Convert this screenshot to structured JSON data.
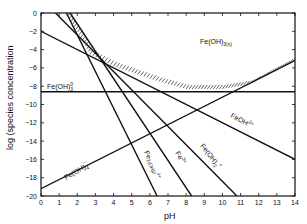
{
  "chart_data": {
    "type": "line",
    "title": "",
    "xlabel": "pH",
    "ylabel": "log (species concentration",
    "xlim": [
      0,
      14
    ],
    "ylim": [
      -20,
      0
    ],
    "x_ticks": [
      0,
      1,
      2,
      3,
      4,
      5,
      6,
      7,
      8,
      9,
      10,
      11,
      12,
      13,
      14
    ],
    "y_ticks": [
      0,
      -2,
      -4,
      -6,
      -8,
      -10,
      -12,
      -14,
      -16,
      -18,
      -20
    ],
    "grid": false,
    "region_label": "Fe(OH)3(s)",
    "series": [
      {
        "name": "Fe(OH)3 0",
        "label": "Fe(OH)3°",
        "x": [
          0,
          14
        ],
        "y": [
          -8.6,
          -8.6
        ]
      },
      {
        "name": "Fe(OH)4-",
        "label": "Fe(OH)4−",
        "x": [
          0,
          14
        ],
        "y": [
          -19.2,
          -5.2
        ]
      },
      {
        "name": "Fe(OH)2+",
        "label": "Fe(OH)2+",
        "x": [
          0,
          14
        ],
        "y": [
          -2.0,
          -16.0
        ]
      },
      {
        "name": "FeOH2+",
        "label": "FeOH2+",
        "x": [
          0.8,
          10.8
        ],
        "y": [
          0,
          -20
        ]
      },
      {
        "name": "Fe3+",
        "label": "Fe3+",
        "x": [
          1.6,
          8.3
        ],
        "y": [
          0,
          -20
        ]
      },
      {
        "name": "Fe2(OH)2 4+",
        "label": "Fe2(OH)2 4+",
        "x": [
          1.4,
          6.4
        ],
        "y": [
          0,
          -20
        ]
      }
    ],
    "solubility_boundary": {
      "x": [
        1.4,
        2.7,
        4.0,
        6.5,
        8.0,
        10.0,
        11.5,
        14.0
      ],
      "y": [
        0,
        -4.5,
        -5.8,
        -7.5,
        -8.3,
        -8.3,
        -7.8,
        -5.2
      ]
    }
  },
  "labels": {
    "x_axis": "pH",
    "y_axis": "log (species concentration",
    "solid": "Fe(OH)",
    "solid_sub": "3(s)",
    "fe_oh3": "Fe(OH)",
    "fe_oh3_sub": "3",
    "fe_oh3_sup": "0",
    "fe_oh4": "Fe(OH)",
    "fe_oh4_sub": "4",
    "fe_oh4_sup": "−",
    "fe2_oh2": "Fe",
    "fe2_oh2_rest": "2(OH)2",
    "fe2_oh2_sup": "4+",
    "fe3": "Fe",
    "fe3_sup": "3+",
    "fe_oh2": "Fe(OH)",
    "fe_oh2_sub": "2",
    "fe_oh2_sup": "+",
    "feoh": "FeOH",
    "feoh_sup": "2+"
  }
}
